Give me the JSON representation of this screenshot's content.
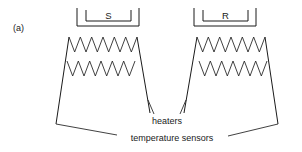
{
  "figure": {
    "part_label": "(a)",
    "background_color": "#ffffff",
    "line_color": "#1a1a1a",
    "width": 302,
    "height": 152
  },
  "cells": [
    {
      "id": "sample",
      "bracket_label": "S",
      "bracket_label_meaning": "sample-cell",
      "heater_count": 2,
      "heater_peaks": 6
    },
    {
      "id": "reference",
      "bracket_label": "R",
      "bracket_label_meaning": "reference-cell",
      "heater_count": 2,
      "heater_peaks": 6
    }
  ],
  "annotations": {
    "heaters": "heaters",
    "temperature_sensors": "temperature sensors"
  }
}
